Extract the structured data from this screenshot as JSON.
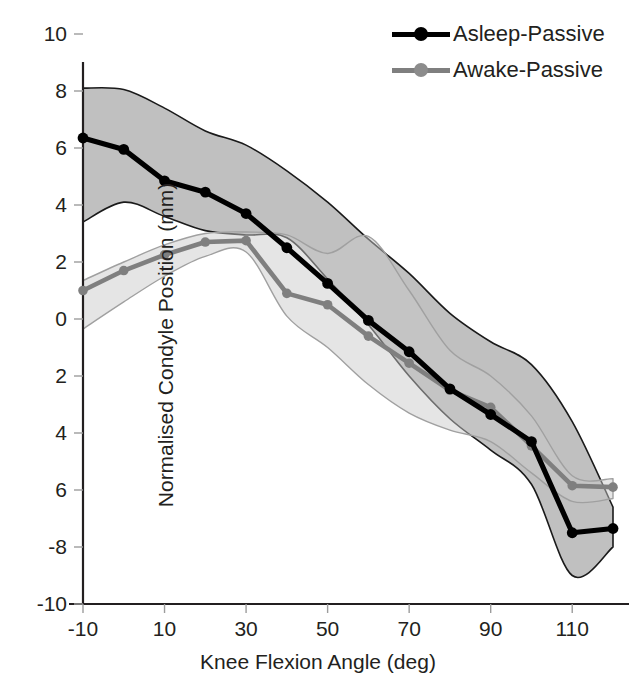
{
  "chart_data": {
    "type": "line",
    "title": "",
    "xlabel": "Knee Flexion Angle (deg)",
    "ylabel": "Normalised Condyle Position (mm)",
    "xlim": [
      -10,
      120
    ],
    "ylim": [
      -10,
      10
    ],
    "xticks": [
      -10,
      10,
      30,
      50,
      70,
      90,
      110
    ],
    "xtick_labels": [
      "-10",
      "10",
      "30",
      "50",
      "70",
      "90",
      "110"
    ],
    "yticks": [
      10,
      8,
      6,
      4,
      2,
      0,
      -2,
      -4,
      -6,
      -8,
      -10
    ],
    "ytick_labels": [
      "10",
      "8",
      "6",
      "4",
      "2",
      "0",
      "2",
      "4",
      "6",
      "-8",
      "-10"
    ],
    "grid": false,
    "legend_position": "top-right",
    "x": [
      -10,
      0,
      10,
      20,
      30,
      40,
      50,
      60,
      70,
      80,
      90,
      100,
      110,
      120
    ],
    "series": [
      {
        "name": "Asleep-Passive",
        "color": "#000000",
        "band_color": "#9a9a9a",
        "marker": "circle",
        "values": [
          6.35,
          5.95,
          4.85,
          4.45,
          3.7,
          2.5,
          1.25,
          -0.05,
          -1.15,
          -2.45,
          -3.35,
          -4.3,
          -7.5,
          -7.35
        ],
        "band_upper": [
          8.1,
          8.05,
          7.4,
          6.6,
          6.1,
          5.2,
          4.1,
          2.8,
          1.6,
          0.2,
          -0.8,
          -1.6,
          -3.6,
          -6.6
        ],
        "band_lower": [
          3.4,
          4.1,
          3.6,
          3.1,
          2.95,
          2.85,
          1.4,
          -0.2,
          -2.0,
          -3.5,
          -4.6,
          -5.8,
          -9.0,
          -8.0
        ]
      },
      {
        "name": "Awake-Passive",
        "color": "#7f7f7f",
        "band_color": "#c8c8c8",
        "marker": "circle",
        "values": [
          1.0,
          1.7,
          2.25,
          2.7,
          2.75,
          0.9,
          0.5,
          -0.6,
          -1.55,
          -2.5,
          -3.1,
          -4.45,
          -5.85,
          -5.9
        ],
        "band_upper": [
          1.35,
          2.0,
          2.6,
          3.0,
          3.05,
          2.95,
          2.3,
          2.9,
          1.0,
          -1.1,
          -2.0,
          -3.4,
          -5.5,
          -5.6
        ],
        "band_lower": [
          -0.35,
          0.6,
          1.5,
          2.2,
          2.35,
          0.1,
          -1.0,
          -2.3,
          -3.3,
          -3.9,
          -4.3,
          -5.4,
          -6.4,
          -6.3
        ]
      }
    ]
  },
  "axis": {
    "x_title": "Knee Flexion Angle (deg)",
    "y_title": "Normalised Condyle Position (mm)"
  },
  "legend": {
    "items": [
      {
        "label": "Asleep-Passive",
        "color": "#000000"
      },
      {
        "label": "Awake-Passive",
        "color": "#7f7f7f"
      }
    ]
  }
}
